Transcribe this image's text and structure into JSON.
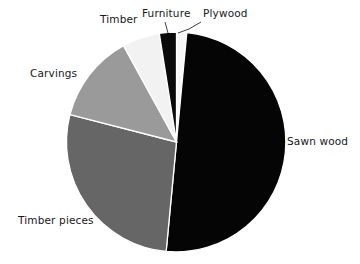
{
  "chart_data": {
    "type": "pie",
    "title": "",
    "subtitle": "",
    "xlabel": "",
    "ylabel": "",
    "legend_position": "none",
    "grid": false,
    "labels_placement": "outside-with-leader-lines",
    "start_angle_deg": 0,
    "direction": "clockwise",
    "categories": [
      "Plywood",
      "Sawn wood",
      "Timber pieces",
      "Carvings",
      "Timber",
      "Furniture"
    ],
    "values": [
      1.5,
      50.0,
      27.5,
      13.0,
      5.5,
      2.5
    ],
    "units": "percent",
    "slices": [
      {
        "label": "Plywood",
        "value": 1.5,
        "color": "#f7f7f7",
        "start_deg": 0.0,
        "end_deg": 5.4,
        "label_x": 203,
        "label_y": 8
      },
      {
        "label": "Sawn wood",
        "value": 50.0,
        "color": "#050505",
        "start_deg": 5.4,
        "end_deg": 185.4,
        "label_x": 287,
        "label_y": 136
      },
      {
        "label": "Timber pieces",
        "value": 27.5,
        "color": "#666666",
        "start_deg": 185.4,
        "end_deg": 284.4,
        "label_x": 18,
        "label_y": 215
      },
      {
        "label": "Carvings",
        "value": 13.0,
        "color": "#9a9a9a",
        "start_deg": 284.4,
        "end_deg": 331.2,
        "label_x": 30,
        "label_y": 68
      },
      {
        "label": "Timber",
        "value": 5.5,
        "color": "#f2f2f2",
        "start_deg": 331.2,
        "end_deg": 351.0,
        "label_x": 100,
        "label_y": 14
      },
      {
        "label": "Furniture",
        "value": 2.5,
        "color": "#0a0a0a",
        "start_deg": 351.0,
        "end_deg": 360.0,
        "label_x": 142,
        "label_y": 8
      }
    ],
    "geometry": {
      "center_x": 176.5,
      "center_y": 142,
      "radius": 110
    },
    "colors": {
      "background": "#ffffff",
      "slice_border": "#ffffff",
      "text": "#17181a",
      "leader_line": "#2a2a2a"
    }
  },
  "labels": {
    "sawn_wood": "Sawn wood",
    "timber_pieces": "Timber pieces",
    "carvings": "Carvings",
    "timber": "Timber",
    "furniture": "Furniture",
    "plywood": "Plywood"
  }
}
